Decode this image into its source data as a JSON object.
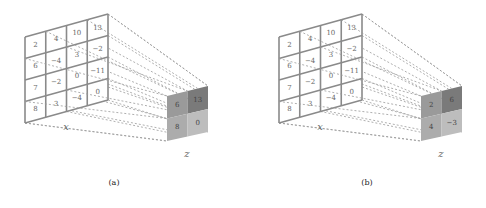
{
  "panels": [
    {
      "id": "a",
      "caption": "(a)",
      "operation": "max-pooling",
      "input_label": "x",
      "output_label": "z",
      "input": [
        [
          "2",
          "4",
          "10",
          "13"
        ],
        [
          "6",
          "−4",
          "3",
          "−2"
        ],
        [
          "7",
          "−2",
          "0",
          "−11"
        ],
        [
          "8",
          "3",
          "−4",
          "0"
        ]
      ],
      "output": [
        [
          "6",
          "13"
        ],
        [
          "8",
          "0"
        ]
      ],
      "output_colors": [
        [
          "#9a9a9a",
          "#7a7a7a"
        ],
        [
          "#acacac",
          "#bdbdbd"
        ]
      ]
    },
    {
      "id": "b",
      "caption": "(b)",
      "operation": "average-pooling",
      "input_label": "x",
      "output_label": "z",
      "input": [
        [
          "2",
          "4",
          "10",
          "13"
        ],
        [
          "6",
          "−4",
          "3",
          "−2"
        ],
        [
          "7",
          "−2",
          "0",
          "−11"
        ],
        [
          "8",
          "3",
          "−4",
          "0"
        ]
      ],
      "output": [
        [
          "2",
          "6"
        ],
        [
          "4",
          "−3"
        ]
      ],
      "output_colors": [
        [
          "#9a9a9a",
          "#7a7a7a"
        ],
        [
          "#acacac",
          "#bdbdbd"
        ]
      ]
    }
  ]
}
